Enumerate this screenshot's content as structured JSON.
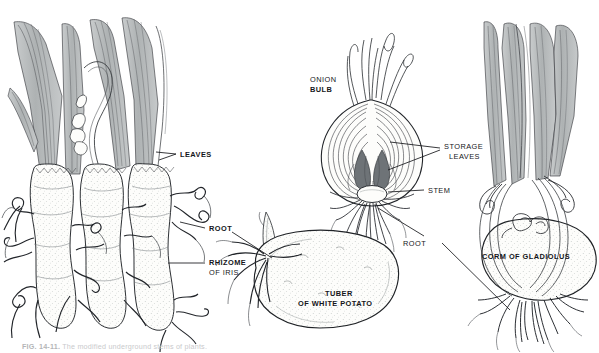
{
  "figure": {
    "type": "botanical-line-illustration",
    "background_color": "#ffffff",
    "ink_color": "#1a1b1f",
    "leaf_fill_color": "#b9bcbd",
    "organ_fill_color": "#fbfbf8",
    "stipple_color": "#9aa0a0",
    "panels": [
      {
        "id": "iris",
        "name": "Rhizome of Iris",
        "position": "left",
        "labels": [
          "LEAVES",
          "ROOT",
          "RHIZOME OF IRIS"
        ]
      },
      {
        "id": "onion",
        "name": "Onion Bulb",
        "position": "center-top",
        "labels": [
          "ONION BULB",
          "STORAGE LEAVES",
          "STEM",
          "ROOT"
        ]
      },
      {
        "id": "potato",
        "name": "Tuber of White Potato",
        "position": "center-bottom",
        "labels": [
          "TUBER OF WHITE POTATO",
          "ROOT"
        ]
      },
      {
        "id": "gladiolus",
        "name": "Corm of Gladiolus",
        "position": "right",
        "labels": [
          "CORM OF GLADIOLUS",
          "ROOT"
        ]
      }
    ]
  },
  "labels": {
    "leaves": "LEAVES",
    "root_iris": "ROOT",
    "rhizome_line1": "RHIZOME",
    "rhizome_line2": "OF IRIS",
    "onion_line1": "ONION",
    "onion_line2": "BULB",
    "storage_line1": "STORAGE",
    "storage_line2": "LEAVES",
    "stem": "STEM",
    "root_right": "ROOT",
    "tuber_line1": "TUBER",
    "tuber_line2": "OF WHITE POTATO",
    "corm": "CORM OF GLADIOLUS"
  },
  "caption": {
    "figure_number": "FIG. 14-11.",
    "text": "The modified underground stems of plants."
  }
}
